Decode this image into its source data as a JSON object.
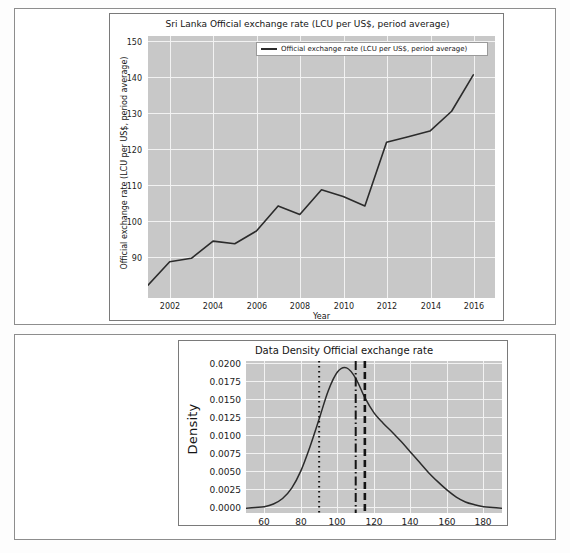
{
  "document": {
    "background_color": "#fdfdfd",
    "panel_border_color": "#8d8d8d"
  },
  "colors": {
    "plot_background": "#c8c8c8",
    "grid": "#f2f2f2",
    "line": "#2b2b2b",
    "text": "#141414"
  },
  "exchange_rate_chart": {
    "title": "Sri Lanka Official exchange rate (LCU per US$, period average)",
    "legend_label": "Official exchange rate (LCU per US$, period average)",
    "xlabel": "Year",
    "ylabel": "Official exchange rate (LCU per US$, period average)",
    "xticks": [
      "2002",
      "2004",
      "2006",
      "2008",
      "2010",
      "2012",
      "2014",
      "2016"
    ],
    "yticks": [
      "90",
      "100",
      "110",
      "120",
      "130",
      "140",
      "150"
    ]
  },
  "density_chart": {
    "title": "Data Density Official exchange rate",
    "ylabel": "Density",
    "xticks": [
      "60",
      "80",
      "100",
      "120",
      "140",
      "160",
      "180"
    ],
    "yticks": [
      "0.0000",
      "0.0025",
      "0.0050",
      "0.0075",
      "0.0100",
      "0.0125",
      "0.0150",
      "0.0175",
      "0.0200"
    ]
  },
  "chart_data": [
    {
      "type": "line",
      "title": "Sri Lanka Official exchange rate (LCU per US$, period average)",
      "xlabel": "Year",
      "ylabel": "Official exchange rate (LCU per US$, period average)",
      "legend": [
        "Official exchange rate (LCU per US$, period average)"
      ],
      "legend_position": "upper center",
      "grid": true,
      "xlim": [
        2001,
        2017
      ],
      "ylim": [
        86,
        156
      ],
      "xticks": [
        2002,
        2004,
        2006,
        2008,
        2010,
        2012,
        2014,
        2016
      ],
      "yticks": [
        90,
        100,
        110,
        120,
        130,
        140,
        150
      ],
      "x": [
        2001,
        2002,
        2003,
        2004,
        2005,
        2006,
        2007,
        2008,
        2009,
        2010,
        2011,
        2012,
        2013,
        2014,
        2015,
        2016
      ],
      "series": [
        {
          "name": "Official exchange rate (LCU per US$, period average)",
          "values": [
            89.4,
            95.7,
            96.6,
            101.2,
            100.5,
            103.9,
            110.6,
            108.3,
            114.9,
            113.1,
            110.6,
            127.6,
            129.1,
            130.6,
            135.9,
            145.6
          ]
        }
      ]
    },
    {
      "type": "line",
      "title": "Data Density Official exchange rate",
      "xlabel": "",
      "ylabel": "Density",
      "grid": true,
      "xlim": [
        50,
        190
      ],
      "ylim": [
        -0.0005,
        0.0215
      ],
      "xticks": [
        60,
        80,
        100,
        120,
        140,
        160,
        180
      ],
      "yticks": [
        0.0,
        0.0025,
        0.005,
        0.0075,
        0.01,
        0.0125,
        0.015,
        0.0175,
        0.02
      ],
      "x": [
        50,
        55,
        60,
        65,
        70,
        75,
        80,
        85,
        90,
        95,
        100,
        105,
        110,
        115,
        120,
        125,
        130,
        135,
        140,
        145,
        150,
        155,
        160,
        165,
        170,
        175,
        180,
        185,
        190
      ],
      "series": [
        {
          "name": "Density",
          "values": [
            0.0002,
            0.0003,
            0.0004,
            0.0008,
            0.0016,
            0.0031,
            0.0056,
            0.0091,
            0.0131,
            0.0172,
            0.0199,
            0.0205,
            0.019,
            0.0162,
            0.014,
            0.0125,
            0.0112,
            0.0098,
            0.0083,
            0.0068,
            0.0053,
            0.004,
            0.0028,
            0.0018,
            0.0011,
            0.0007,
            0.0004,
            0.0003,
            0.0002
          ]
        }
      ],
      "vertical_lines": [
        {
          "name": "dotted-reference-line",
          "x": 90,
          "style": "dotted"
        },
        {
          "name": "dash-dot-reference-line",
          "x": 110,
          "style": "dashdot"
        },
        {
          "name": "dashed-reference-line",
          "x": 115,
          "style": "dashed"
        }
      ]
    }
  ]
}
